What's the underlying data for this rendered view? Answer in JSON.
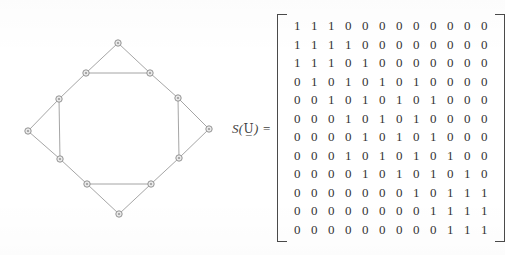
{
  "figure": {
    "equation_label": {
      "function_name": "S",
      "open_paren": "(",
      "argument": "U̲",
      "close_paren": ")",
      "equals": "="
    }
  },
  "graph": {
    "vertex_count": 12,
    "edge_count": 20,
    "vertices": [
      {
        "id": "v1",
        "name": "top-apex",
        "x": 118,
        "y": 43
      },
      {
        "id": "v2",
        "name": "upper-left-oct",
        "x": 86,
        "y": 73
      },
      {
        "id": "v3",
        "name": "upper-right-oct",
        "x": 150,
        "y": 73
      },
      {
        "id": "v4",
        "name": "left-upper-oct",
        "x": 59,
        "y": 99
      },
      {
        "id": "v5",
        "name": "right-upper-oct",
        "x": 178,
        "y": 98
      },
      {
        "id": "v6",
        "name": "left-apex",
        "x": 28,
        "y": 131
      },
      {
        "id": "v7",
        "name": "right-apex",
        "x": 209,
        "y": 129
      },
      {
        "id": "v8",
        "name": "left-lower-oct",
        "x": 60,
        "y": 159
      },
      {
        "id": "v9",
        "name": "right-lower-oct",
        "x": 179,
        "y": 158
      },
      {
        "id": "v10",
        "name": "lower-left-oct",
        "x": 87,
        "y": 184
      },
      {
        "id": "v11",
        "name": "lower-right-oct",
        "x": 151,
        "y": 184
      },
      {
        "id": "v12",
        "name": "bottom-apex",
        "x": 119,
        "y": 214
      }
    ],
    "edges": [
      [
        "v1",
        "v2"
      ],
      [
        "v1",
        "v3"
      ],
      [
        "v2",
        "v3"
      ],
      [
        "v2",
        "v4"
      ],
      [
        "v3",
        "v5"
      ],
      [
        "v4",
        "v6"
      ],
      [
        "v5",
        "v7"
      ],
      [
        "v4",
        "v8"
      ],
      [
        "v5",
        "v9"
      ],
      [
        "v6",
        "v8"
      ],
      [
        "v7",
        "v9"
      ],
      [
        "v8",
        "v10"
      ],
      [
        "v9",
        "v11"
      ],
      [
        "v10",
        "v11"
      ],
      [
        "v10",
        "v12"
      ],
      [
        "v11",
        "v12"
      ]
    ]
  },
  "matrix": {
    "rows": 12,
    "columns": 12,
    "bracket_style": "square",
    "values": [
      [
        1,
        1,
        1,
        0,
        0,
        0,
        0,
        0,
        0,
        0,
        0,
        0
      ],
      [
        1,
        1,
        1,
        1,
        0,
        0,
        0,
        0,
        0,
        0,
        0,
        0
      ],
      [
        1,
        1,
        1,
        0,
        1,
        0,
        0,
        0,
        0,
        0,
        0,
        0
      ],
      [
        0,
        1,
        0,
        1,
        0,
        1,
        0,
        1,
        0,
        0,
        0,
        0
      ],
      [
        0,
        0,
        1,
        0,
        1,
        0,
        1,
        0,
        1,
        0,
        0,
        0
      ],
      [
        0,
        0,
        0,
        1,
        0,
        1,
        0,
        1,
        0,
        0,
        0,
        0
      ],
      [
        0,
        0,
        0,
        0,
        1,
        0,
        1,
        0,
        1,
        0,
        0,
        0
      ],
      [
        0,
        0,
        0,
        1,
        0,
        1,
        0,
        1,
        0,
        1,
        0,
        0
      ],
      [
        0,
        0,
        0,
        0,
        1,
        0,
        1,
        0,
        1,
        0,
        1,
        0
      ],
      [
        0,
        0,
        0,
        0,
        0,
        0,
        0,
        1,
        0,
        1,
        1,
        1
      ],
      [
        0,
        0,
        0,
        0,
        0,
        0,
        0,
        0,
        1,
        1,
        1,
        1
      ],
      [
        0,
        0,
        0,
        0,
        0,
        0,
        0,
        0,
        0,
        1,
        1,
        1
      ]
    ]
  },
  "colors": {
    "background": "#ffffff",
    "ink": "#333333",
    "edge_stroke": "#8e8e8e",
    "vertex_fill": "#e9e9e9",
    "vertex_stroke": "#8a8a8a",
    "bracket": "#4a4a4a"
  }
}
